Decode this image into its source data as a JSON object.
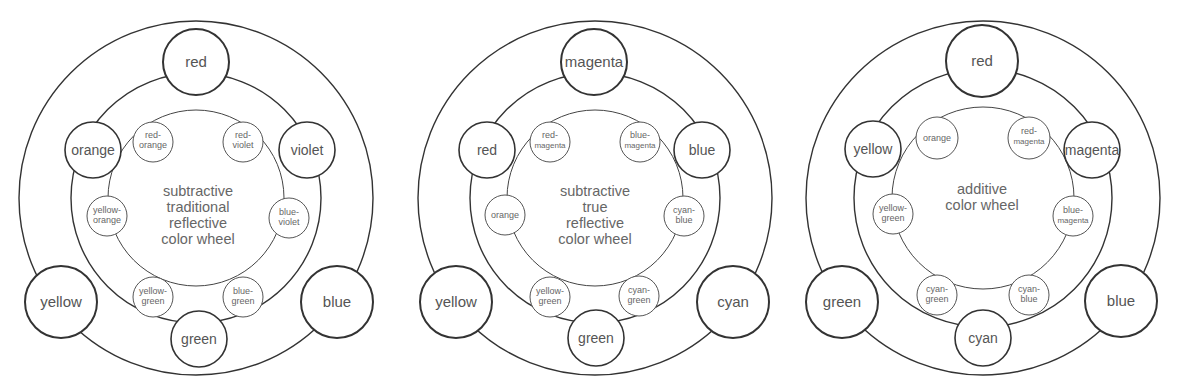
{
  "wheels": [
    {
      "title_lines": [
        "subtractive",
        "traditional",
        "reflective",
        "color  wheel"
      ],
      "primaries": [
        "red",
        "yellow",
        "blue"
      ],
      "secondaries": [
        "orange",
        "violet",
        "green"
      ],
      "tertiaries": [
        [
          "red-",
          "orange"
        ],
        [
          "red-",
          "violet"
        ],
        [
          "yellow-",
          "orange"
        ],
        [
          "blue-",
          "violet"
        ],
        [
          "yellow-",
          "green"
        ],
        [
          "blue-",
          "green"
        ]
      ]
    },
    {
      "title_lines": [
        "subtractive",
        "true",
        "reflective",
        "color  wheel"
      ],
      "primaries": [
        "magenta",
        "yellow",
        "cyan"
      ],
      "secondaries": [
        "red",
        "blue",
        "green"
      ],
      "tertiaries": [
        [
          "red-",
          "magenta"
        ],
        [
          "blue-",
          "magenta"
        ],
        [
          "orange",
          ""
        ],
        [
          "cyan-",
          "blue"
        ],
        [
          "yellow-",
          "green"
        ],
        [
          "cyan-",
          "green"
        ]
      ]
    },
    {
      "title_lines": [
        "additive",
        "color  wheel",
        "",
        ""
      ],
      "primaries": [
        "red",
        "green",
        "blue"
      ],
      "secondaries": [
        "yellow",
        "magenta",
        "cyan"
      ],
      "tertiaries": [
        [
          "orange",
          ""
        ],
        [
          "red-",
          "magenta"
        ],
        [
          "yellow-",
          "green"
        ],
        [
          "blue-",
          "magenta"
        ],
        [
          "cyan-",
          "green"
        ],
        [
          "cyan-",
          "blue"
        ]
      ]
    }
  ]
}
